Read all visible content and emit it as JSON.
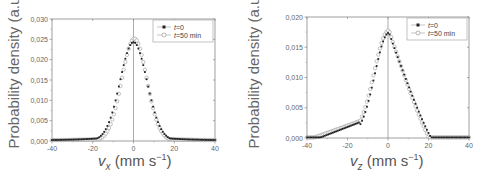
{
  "chart_data": [
    {
      "type": "scatter",
      "title": "",
      "xlabel": "v_x (mm s^-1)",
      "xlabel_var": "v",
      "xlabel_sub": "x",
      "xlabel_units": "(mm s",
      "xlabel_exp": "−1",
      "xlabel_close": ")",
      "ylabel": "Probability density (a.u.)",
      "xlim": [
        -40,
        40
      ],
      "ylim": [
        0,
        0.03
      ],
      "xticks": [
        -40,
        -20,
        0,
        20,
        40
      ],
      "xtick_labels": [
        "-40",
        "-20",
        "0",
        "20",
        "40"
      ],
      "yticks": [
        0,
        0.005,
        0.01,
        0.015,
        0.02,
        0.025,
        0.03
      ],
      "ytick_labels": [
        "0,000",
        "0,005",
        "0,010",
        "0,015",
        "0,020",
        "0,025",
        "0,030"
      ],
      "grid": false,
      "vertical_line_at": 0,
      "legend_position": "upper right",
      "series": [
        {
          "name": "t=0",
          "name_var": "t",
          "name_rest": "=0",
          "marker": "filled-square",
          "color": "#222222",
          "model": {
            "kind": "gauss",
            "amp": 0.0243,
            "mu": 0.0,
            "sigma": 6.6,
            "tail": 0.0009,
            "tail_sigma": 18
          }
        },
        {
          "name": "t=50 min",
          "name_var": "t",
          "name_rest": "=50 min",
          "marker": "open-circle",
          "color": "#999999",
          "model": {
            "kind": "gauss",
            "amp": 0.0252,
            "mu": 0.4,
            "sigma": 6.1,
            "tail": 0.0005,
            "tail_sigma": 18
          }
        }
      ],
      "peak_values": {
        "t=0": 0.0243,
        "t=50 min": 0.0252
      }
    },
    {
      "type": "scatter",
      "title": "",
      "xlabel": "v_z (mm s^-1)",
      "xlabel_var": "v",
      "xlabel_sub": "z",
      "xlabel_units": "(mm s",
      "xlabel_exp": "−1",
      "xlabel_close": ")",
      "ylabel": "Probability density (a.u.)",
      "xlim": [
        -40,
        40
      ],
      "ylim": [
        0,
        0.02
      ],
      "xticks": [
        -40,
        -20,
        0,
        20,
        40
      ],
      "xtick_labels": [
        "-40",
        "-20",
        "0",
        "20",
        "40"
      ],
      "yticks": [
        0,
        0.005,
        0.01,
        0.015,
        0.02
      ],
      "ytick_labels": [
        "0,000",
        "0,005",
        "0,010",
        "0,015",
        "0,020"
      ],
      "grid": false,
      "vertical_line_at": 0,
      "legend_position": "upper right",
      "series": [
        {
          "name": "t=0",
          "name_var": "t",
          "name_rest": "=0",
          "marker": "filled-square",
          "color": "#222222",
          "model": {
            "kind": "skew",
            "amp": 0.0174,
            "mu": 0.5,
            "sigma_left": 7.0,
            "sigma_right": 9.2,
            "cutoff": 21.5,
            "shoulder_amp": 0.0026,
            "shoulder_start": -34,
            "shoulder_end": -14
          }
        },
        {
          "name": "t=50 min",
          "name_var": "t",
          "name_rest": "=50 min",
          "marker": "open-circle",
          "color": "#999999",
          "model": {
            "kind": "skew",
            "amp": 0.0178,
            "mu": 0.5,
            "sigma_left": 7.4,
            "sigma_right": 8.4,
            "cutoff": 20.5,
            "shoulder_amp": 0.0029,
            "shoulder_start": -37,
            "shoulder_end": -13
          }
        }
      ],
      "peak_values": {
        "t=0": 0.0174,
        "t=50 min": 0.0178
      }
    }
  ]
}
